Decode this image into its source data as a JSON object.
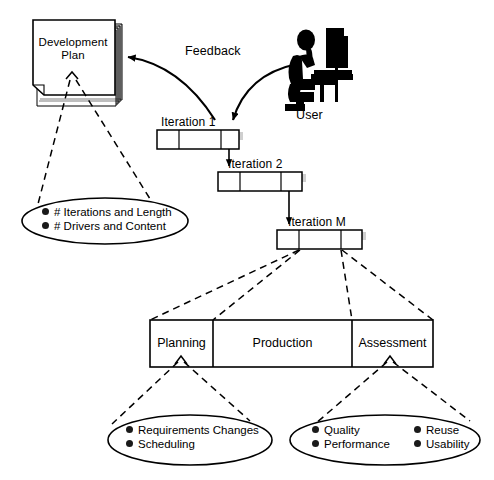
{
  "diagram": {
    "title_document": {
      "name": "development-plan",
      "line1": "Development",
      "line2": "Plan",
      "label": "Development Plan"
    },
    "actor": {
      "label": "User",
      "icon": "user-at-computer-icon"
    },
    "flows": {
      "feedback_label": "Feedback"
    },
    "iterations": [
      {
        "label": "Iteration  1",
        "name": "iteration-1"
      },
      {
        "label": "Iteration  2",
        "name": "iteration-2"
      },
      {
        "label": "Iteration  M",
        "name": "iteration-m"
      }
    ],
    "phases": [
      {
        "label": "Planning",
        "name": "phase-planning"
      },
      {
        "label": "Production",
        "name": "phase-production"
      },
      {
        "label": "Assessment",
        "name": "phase-assessment"
      }
    ],
    "callouts": {
      "plan_details": {
        "name": "development-plan-callout",
        "items": [
          "#  Iterations  and  Length",
          "#  Drivers  and  Content"
        ]
      },
      "planning_details": {
        "name": "planning-callout",
        "items": [
          "Requirements  Changes",
          "Scheduling"
        ]
      },
      "assessment_details": {
        "name": "assessment-callout",
        "column_left": [
          "Quality",
          "Performance"
        ],
        "column_right": [
          "Reuse",
          "Usability"
        ]
      }
    },
    "colors": {
      "stroke": "#000000",
      "fill": "#ffffff",
      "shadow": "#c9c9c9",
      "bullet": "#1a1a1a"
    }
  }
}
